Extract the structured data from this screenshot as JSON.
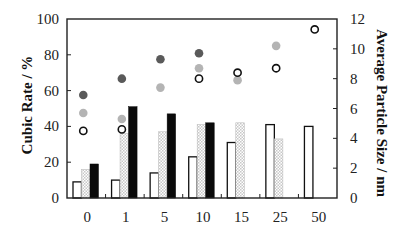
{
  "chart_data": {
    "type": "bar",
    "title": "",
    "xlabel": "",
    "ylabel": "Cubic Rate / %",
    "y2label": "Average Particle Size / nm",
    "ylim": [
      0,
      100
    ],
    "y2lim": [
      0,
      12
    ],
    "yticks": [
      "0",
      "20",
      "40",
      "60",
      "80",
      "100"
    ],
    "y2ticks": [
      "0",
      "2",
      "4",
      "6",
      "8",
      "10",
      "12"
    ],
    "categories": [
      "0",
      "1",
      "5",
      "10",
      "15",
      "25",
      "50"
    ],
    "grid": false,
    "legend": null,
    "bar_series": [
      {
        "name": "series-white",
        "axis": "left",
        "style": "open",
        "values": [
          9,
          10,
          14,
          23,
          31,
          41,
          40
        ]
      },
      {
        "name": "series-hatched",
        "axis": "left",
        "style": "checker",
        "values": [
          16,
          36,
          37,
          41,
          42,
          33,
          null
        ]
      },
      {
        "name": "series-black",
        "axis": "left",
        "style": "black",
        "values": [
          19,
          51,
          47,
          42,
          null,
          null,
          null
        ]
      }
    ],
    "point_series": [
      {
        "name": "series-dark-gray-dots",
        "axis": "right",
        "style": "filled-dark",
        "color": "#5a5a5a",
        "values": [
          6.9,
          8.0,
          9.3,
          9.7,
          null,
          null,
          null
        ]
      },
      {
        "name": "series-light-gray-dots",
        "axis": "right",
        "style": "filled-light",
        "color": "#b4b4b4",
        "values": [
          5.7,
          5.3,
          7.4,
          8.7,
          7.9,
          10.2,
          null
        ]
      },
      {
        "name": "series-open-circles",
        "axis": "right",
        "style": "open",
        "color": "#111111",
        "values": [
          4.5,
          4.6,
          null,
          8.0,
          8.4,
          8.7,
          11.3
        ]
      }
    ]
  },
  "colors": {
    "axis": "#222222",
    "bar_outline": "#111111",
    "black_bar": "#0a0a0a",
    "checker_light": "#ffffff",
    "checker_dark": "#c8c8c8"
  }
}
